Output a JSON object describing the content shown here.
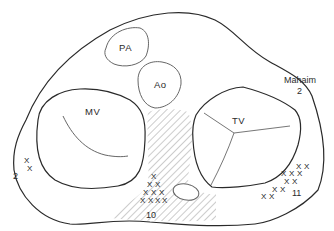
{
  "diagram": {
    "structures": {
      "pa": "PA",
      "ao": "Ao",
      "mv": "MV",
      "tv": "TV"
    },
    "annotations": {
      "mahaim_label": "Mahaim",
      "mahaim_count": "2",
      "left_count": "2",
      "septal_count": "10",
      "right_count": "11"
    },
    "marker_glyph": "X",
    "colors": {
      "outline": "#2a2a2a",
      "inner": "#555555",
      "hatch": "#9a9a9a"
    }
  }
}
